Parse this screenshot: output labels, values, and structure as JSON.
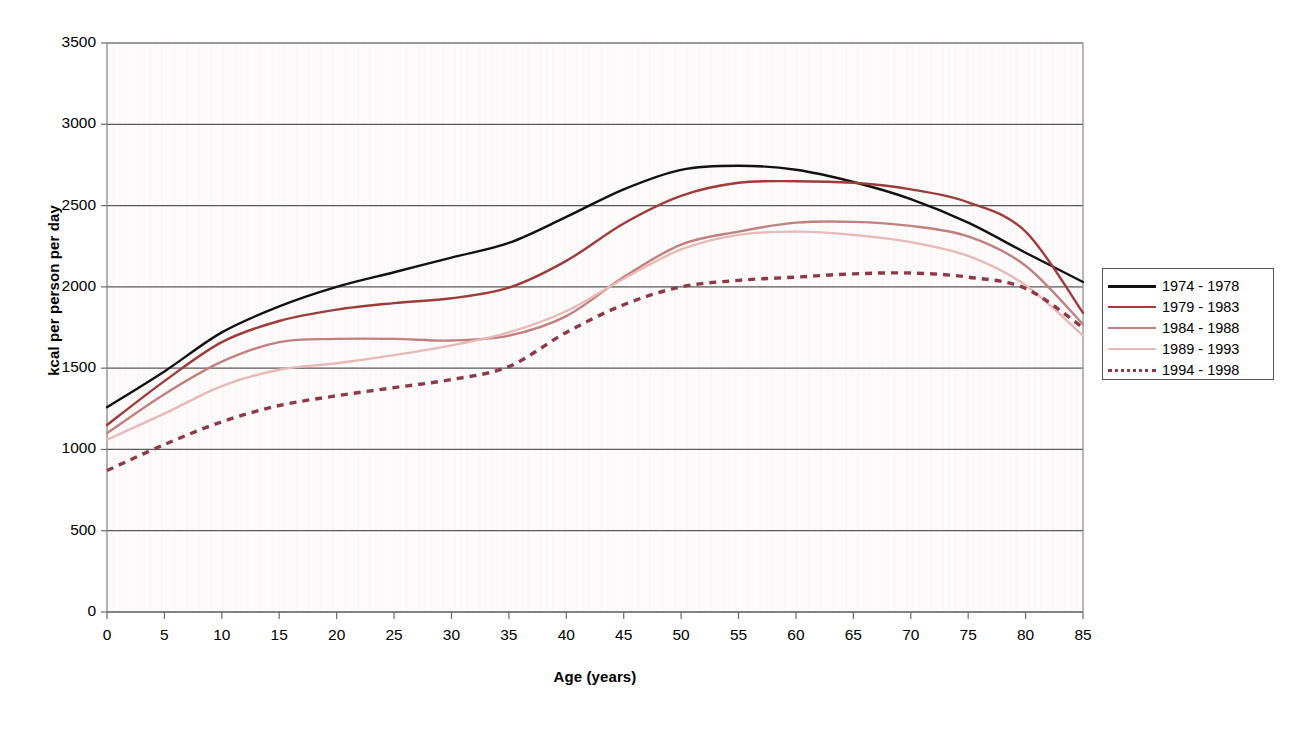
{
  "chart_data": {
    "type": "line",
    "title": "",
    "xlabel": "Age (years)",
    "ylabel": "kcal per person per day",
    "xlim": [
      0,
      85
    ],
    "ylim": [
      0,
      3500
    ],
    "ytick_labels": [
      "0",
      "500",
      "1000",
      "1500",
      "2000",
      "2500",
      "3000",
      "3500"
    ],
    "yticks": [
      0,
      500,
      1000,
      1500,
      2000,
      2500,
      3000,
      3500
    ],
    "xtick_labels": [
      "0",
      "5",
      "10",
      "15",
      "20",
      "25",
      "30",
      "35",
      "40",
      "45",
      "50",
      "55",
      "60",
      "65",
      "70",
      "75",
      "80",
      "85"
    ],
    "xticks": [
      0,
      5,
      10,
      15,
      20,
      25,
      30,
      35,
      40,
      45,
      50,
      55,
      60,
      65,
      70,
      75,
      80,
      85
    ],
    "grid": "horizontal",
    "legend_position": "right",
    "plot_background": "#fcfafa",
    "gridline_color": "#595959",
    "x": [
      0,
      5,
      10,
      15,
      20,
      25,
      30,
      35,
      40,
      45,
      50,
      55,
      60,
      65,
      70,
      75,
      80,
      85
    ],
    "series": [
      {
        "name": "1974 - 1978",
        "color": "#111111",
        "style": "solid",
        "values": [
          1260,
          1480,
          1720,
          1880,
          2000,
          2090,
          2180,
          2270,
          2430,
          2600,
          2720,
          2745,
          2720,
          2645,
          2540,
          2395,
          2210,
          2030
        ]
      },
      {
        "name": "1979 - 1983",
        "color": "#9e3b3b",
        "style": "solid",
        "values": [
          1150,
          1420,
          1660,
          1790,
          1860,
          1900,
          1930,
          1995,
          2160,
          2390,
          2560,
          2640,
          2650,
          2640,
          2600,
          2520,
          2340,
          1840
        ]
      },
      {
        "name": "1984 - 1988",
        "color": "#c08080",
        "style": "solid",
        "values": [
          1100,
          1340,
          1540,
          1660,
          1680,
          1680,
          1670,
          1700,
          1820,
          2060,
          2260,
          2340,
          2395,
          2400,
          2375,
          2310,
          2130,
          1770
        ]
      },
      {
        "name": "1989 - 1993",
        "color": "#e7b9b9",
        "style": "solid",
        "values": [
          1060,
          1220,
          1390,
          1490,
          1530,
          1580,
          1640,
          1720,
          1850,
          2050,
          2230,
          2320,
          2340,
          2320,
          2275,
          2190,
          2010,
          1700
        ]
      },
      {
        "name": "1994 - 1998",
        "color": "#8e3a46",
        "style": "dotted",
        "values": [
          870,
          1030,
          1170,
          1270,
          1330,
          1380,
          1430,
          1510,
          1720,
          1890,
          2000,
          2040,
          2060,
          2080,
          2085,
          2060,
          1990,
          1750
        ]
      }
    ]
  },
  "axis": {
    "y_title": "kcal per person per day",
    "x_title": "Age (years)"
  }
}
